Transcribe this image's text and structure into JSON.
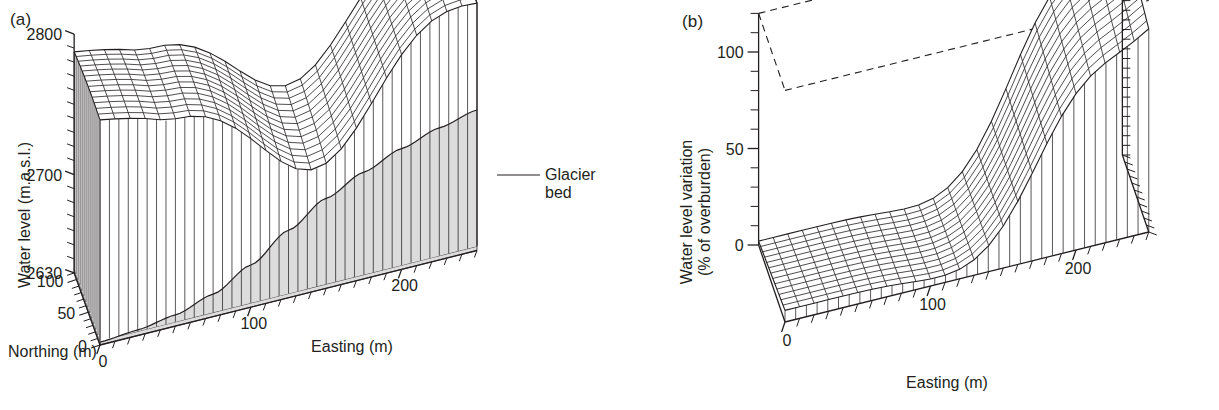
{
  "figure": {
    "background_color": "#ffffff",
    "line_color": "#231f20",
    "fill_color": "#dcdcdc"
  },
  "panels": [
    {
      "tag": "(a)",
      "chart_data": {
        "type": "surface3d",
        "title": "",
        "xlabel": "Easting (m)",
        "ylabel": "Northing (m)",
        "zlabel": "Water level (m.a.s.l.)",
        "xlim": [
          0,
          250
        ],
        "ylim": [
          0,
          110
        ],
        "zlim": [
          2630,
          2800
        ],
        "xticks": [
          0,
          100,
          200
        ],
        "xticklabels": [
          "0",
          "100",
          "200"
        ],
        "yticks": [
          0,
          50,
          100
        ],
        "yticklabels": [
          "0",
          "50",
          "100"
        ],
        "zticks": [
          2630,
          2700,
          2800
        ],
        "zticklabels": [
          "2630",
          "2700",
          "2800"
        ],
        "grid": false,
        "legend": "none",
        "annotations": [
          {
            "text": "Glacier bed",
            "lines": [
              "Glacier",
              "bed"
            ],
            "leader": true
          }
        ],
        "surface_note": "Water table surface: high broad dome to the west, deep trough near Easting 150 m, secondary ridge to the east.",
        "surface_nx": 26,
        "surface_ny": 14,
        "bed_note": "Grey shaded glacier bed rises from west to east beneath the water table.",
        "bed_profile_x": [
          0,
          25,
          50,
          75,
          100,
          125,
          150,
          175,
          200,
          225,
          250
        ],
        "bed_profile_z": [
          2632,
          2634,
          2638,
          2646,
          2660,
          2678,
          2694,
          2706,
          2716,
          2724,
          2730
        ]
      }
    },
    {
      "tag": "(b)",
      "chart_data": {
        "type": "surface3d",
        "title": "",
        "xlabel": "Easting (m)",
        "ylabel": "",
        "zlabel": "Water level variation (% of overburden)",
        "zlabel_lines": [
          "Water level variation",
          "(% of overburden)"
        ],
        "xlim": [
          0,
          250
        ],
        "ylim": [
          0,
          110
        ],
        "zlim": [
          0,
          120
        ],
        "xticks": [
          0,
          100,
          200
        ],
        "xticklabels": [
          "0",
          "100",
          "200"
        ],
        "zticks": [
          0,
          50,
          100
        ],
        "zticklabels": [
          "0",
          "50",
          "100"
        ],
        "grid": false,
        "legend": "none",
        "annotations": [],
        "surface_note": "Variation surface: near zero over the western basin, rising to a broad ridge above 100% near Easting 200 m.",
        "surface_nx": 26,
        "surface_ny": 14,
        "dashed_frame": true
      }
    }
  ]
}
